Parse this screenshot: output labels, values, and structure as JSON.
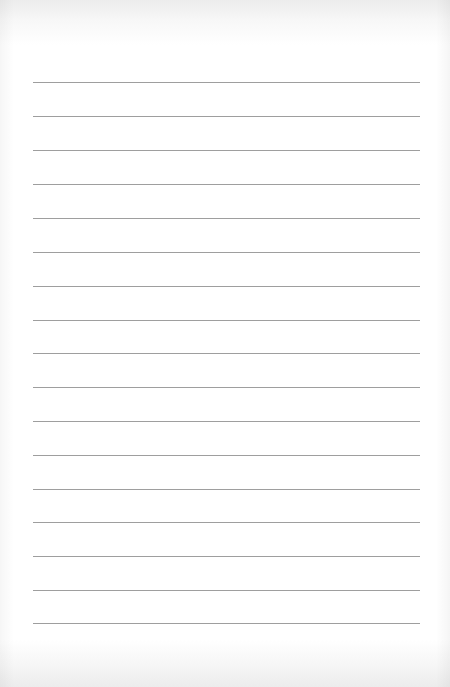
{
  "page": {
    "type": "lined-paper",
    "line_color": "#9e9e9e",
    "background": "#ffffff",
    "line_count": 17,
    "lines": [
      {
        "y": 82
      },
      {
        "y": 116
      },
      {
        "y": 150
      },
      {
        "y": 184
      },
      {
        "y": 218
      },
      {
        "y": 252
      },
      {
        "y": 286
      },
      {
        "y": 320
      },
      {
        "y": 353
      },
      {
        "y": 387
      },
      {
        "y": 421
      },
      {
        "y": 455
      },
      {
        "y": 489
      },
      {
        "y": 522
      },
      {
        "y": 556
      },
      {
        "y": 590
      },
      {
        "y": 623
      }
    ]
  }
}
